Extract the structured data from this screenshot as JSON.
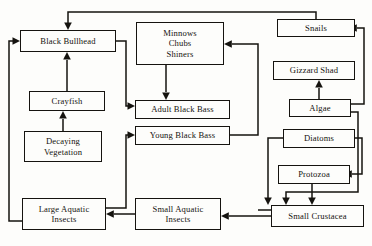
{
  "diagram": {
    "type": "food-web-flow-chart",
    "title": "",
    "nodes": [
      {
        "id": "black-bullhead",
        "label": "Black Bullhead",
        "x": 20,
        "y": 30,
        "w": 96,
        "h": 22
      },
      {
        "id": "minnows",
        "label": "Minnows\nChubs\nShiners",
        "x": 136,
        "y": 22,
        "w": 88,
        "h": 43
      },
      {
        "id": "snails",
        "label": "Snails",
        "x": 277,
        "y": 19,
        "w": 78,
        "h": 18
      },
      {
        "id": "gizzard-shad",
        "label": "Gizzard Shad",
        "x": 273,
        "y": 61,
        "w": 82,
        "h": 19
      },
      {
        "id": "crayfish",
        "label": "Crayfish",
        "x": 29,
        "y": 91,
        "w": 76,
        "h": 20
      },
      {
        "id": "adult-black-bass",
        "label": "Adult Black Bass",
        "x": 135,
        "y": 100,
        "w": 95,
        "h": 19
      },
      {
        "id": "algae",
        "label": "Algae",
        "x": 289,
        "y": 99,
        "w": 62,
        "h": 18
      },
      {
        "id": "young-black-bass",
        "label": "Young Black Bass",
        "x": 135,
        "y": 126,
        "w": 95,
        "h": 19
      },
      {
        "id": "decaying-vegetation",
        "label": "Decaying\nVegetation",
        "x": 24,
        "y": 131,
        "w": 78,
        "h": 31
      },
      {
        "id": "diatoms",
        "label": "Diatoms",
        "x": 283,
        "y": 129,
        "w": 72,
        "h": 19
      },
      {
        "id": "protozoa",
        "label": "Protozoa",
        "x": 278,
        "y": 165,
        "w": 72,
        "h": 19
      },
      {
        "id": "large-aquatic-insects",
        "label": "Large Aquatic\nInsects",
        "x": 22,
        "y": 198,
        "w": 84,
        "h": 32
      },
      {
        "id": "small-aquatic-insects",
        "label": "Small Aquatic\nInsects",
        "x": 135,
        "y": 198,
        "w": 86,
        "h": 32
      },
      {
        "id": "small-crustacea",
        "label": "Small Crustacea",
        "x": 271,
        "y": 205,
        "w": 93,
        "h": 22
      }
    ],
    "edges": [
      {
        "from": "snails",
        "to": "black-bullhead",
        "note": "snails to black bullhead via top route"
      },
      {
        "from": "black-bullhead",
        "to": "adult-black-bass",
        "note": "right side down to adult bass"
      },
      {
        "from": "crayfish",
        "to": "black-bullhead",
        "note": "upward"
      },
      {
        "from": "decaying-vegetation",
        "to": "crayfish",
        "note": "upward"
      },
      {
        "from": "large-aquatic-insects",
        "to": "black-bullhead",
        "note": "far left vertical up"
      },
      {
        "from": "large-aquatic-insects",
        "to": "young-black-bass",
        "note": "up then right"
      },
      {
        "from": "minnows",
        "to": "adult-black-bass",
        "note": "downward"
      },
      {
        "from": "young-black-bass",
        "to": "minnows",
        "note": "right column up to minnows"
      },
      {
        "from": "small-aquatic-insects",
        "to": "large-aquatic-insects",
        "note": "leftward"
      },
      {
        "from": "small-crustacea",
        "to": "small-aquatic-insects",
        "note": "leftward"
      },
      {
        "from": "small-crustacea",
        "to": "young-black-bass",
        "note": "up then left"
      },
      {
        "from": "algae",
        "to": "gizzard-shad",
        "note": "upward"
      },
      {
        "from": "algae",
        "to": "snails",
        "note": "right then up"
      },
      {
        "from": "algae",
        "to": "small-crustacea",
        "note": "down the middle-right"
      },
      {
        "from": "diatoms",
        "to": "small-crustacea",
        "note": "down"
      },
      {
        "from": "diatoms",
        "to": "protozoa",
        "note": "left then down into protozoa"
      },
      {
        "from": "protozoa",
        "to": "small-crustacea",
        "note": "downward"
      }
    ],
    "colors": {
      "ink": "#15130f",
      "paper": "#fdfdfb"
    }
  }
}
